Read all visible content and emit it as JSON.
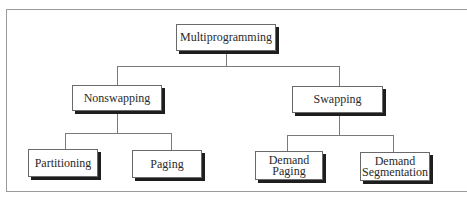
{
  "diagram": {
    "type": "tree",
    "root": {
      "label": "Multiprogramming",
      "children": [
        {
          "label": "Nonswapping",
          "children": [
            {
              "label": "Partitioning"
            },
            {
              "label": "Paging"
            }
          ]
        },
        {
          "label": "Swapping",
          "children": [
            {
              "label": "Demand Paging"
            },
            {
              "label": "Demand Segmentation"
            }
          ]
        }
      ]
    },
    "nodes": {
      "multiprogramming": "Multiprogramming",
      "nonswapping": "Nonswapping",
      "swapping": "Swapping",
      "partitioning": "Partitioning",
      "paging": "Paging",
      "demand_paging_line1": "Demand",
      "demand_paging_line2": "Paging",
      "demand_segmentation_line1": "Demand",
      "demand_segmentation_line2": "Segmentation"
    },
    "colors": {
      "border": "#6a6a6a",
      "shadow": "#1e1e1e",
      "connector": "#7a7a7a",
      "frame": "#9a9a9a"
    }
  }
}
